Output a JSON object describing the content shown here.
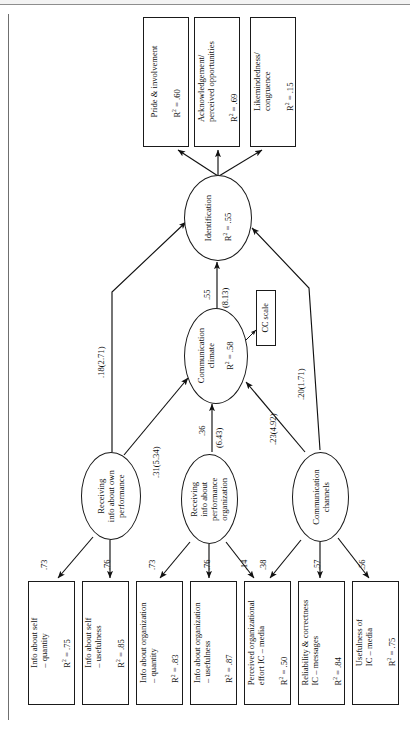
{
  "figure": {
    "type": "structural-equation-model-path-diagram",
    "orientation": "rotated-90-counterclockwise",
    "note_box": {
      "label": "CC scale"
    }
  },
  "outcomes": [
    {
      "id": "pride",
      "name": "Pride & involvement",
      "r2_label": "R² = .60",
      "r2": 0.6
    },
    {
      "id": "ack",
      "name": "Acknowledgement/\nperceived opportunities",
      "r2_label": "R² = .69",
      "r2": 0.69
    },
    {
      "id": "likeminded",
      "name": "Likemindedness/\ncongruence",
      "r2_label": "R² = .15",
      "r2": 0.15
    }
  ],
  "latents": [
    {
      "id": "identification",
      "name": "Identification",
      "r2_label": "R² = .55",
      "r2": 0.55
    },
    {
      "id": "climate",
      "name": "Communication\nclimate",
      "r2_label": "R² = .58",
      "r2": 0.58
    },
    {
      "id": "recv_own",
      "name": "Receiving\ninfo about own\nperformance",
      "r2_label": "",
      "r2": null
    },
    {
      "id": "recv_org",
      "name": "Receiving\ninfo about\nperformance\norganization",
      "r2_label": "",
      "r2": null
    },
    {
      "id": "channels",
      "name": "Communication\nchannels",
      "r2_label": "",
      "r2": null
    }
  ],
  "manifests": [
    {
      "id": "self_qty",
      "name": "Info about self\n– quantity",
      "r2_label": "R² = .75",
      "r2": 0.75
    },
    {
      "id": "self_use",
      "name": "Info about self\n– usefulness",
      "r2_label": "R² = .85",
      "r2": 0.85
    },
    {
      "id": "org_qty",
      "name": "Info about organization\n– quantity",
      "r2_label": "R² = .83",
      "r2": 0.83
    },
    {
      "id": "org_use",
      "name": "Info about organization\n– usefulness",
      "r2_label": "R² = .87",
      "r2": 0.87
    },
    {
      "id": "eff_media",
      "name": "Perceived organizational\neffort IC – media",
      "r2_label": "R² = .50",
      "r2": 0.5
    },
    {
      "id": "rel_msg",
      "name": "Reliability & correctness\nIC – messages",
      "r2_label": "R² = .84",
      "r2": 0.84
    },
    {
      "id": "use_media",
      "name": "Usefulness of\nIC – media",
      "r2_label": "R² = .75",
      "r2": 0.75
    }
  ],
  "structural_paths": [
    {
      "from": "recv_own",
      "to": "identification",
      "label": ".18(2.71)",
      "beta": 0.18,
      "t": 2.71
    },
    {
      "from": "recv_own",
      "to": "climate",
      "label": ".31(5.34)",
      "beta": 0.31,
      "t": 5.34
    },
    {
      "from": "recv_org",
      "to": "climate",
      "label": ".36",
      "label2": "(6.43)",
      "beta": 0.36,
      "t": 6.43
    },
    {
      "from": "channels",
      "to": "climate",
      "label": ".23(4.92)",
      "beta": 0.23,
      "t": 4.92
    },
    {
      "from": "channels",
      "to": "identification",
      "label": ".20(1.71)",
      "beta": 0.2,
      "t": 1.71
    },
    {
      "from": "climate",
      "to": "identification",
      "label": ".55",
      "label2": "(8.13)",
      "beta": 0.55,
      "t": 8.13
    }
  ],
  "loadings": [
    {
      "from": "recv_own",
      "to": "self_qty",
      "label": ".73",
      "value": 0.73
    },
    {
      "from": "recv_own",
      "to": "self_use",
      "label": ".76",
      "value": 0.76
    },
    {
      "from": "recv_org",
      "to": "org_qty",
      "label": ".73",
      "value": 0.73
    },
    {
      "from": "recv_org",
      "to": "org_use",
      "label": ".76",
      "value": 0.76
    },
    {
      "from": "recv_org",
      "to": "eff_media",
      "label": ".14",
      "value": 0.14
    },
    {
      "from": "channels",
      "to": "eff_media",
      "label": ".38",
      "value": 0.38
    },
    {
      "from": "channels",
      "to": "rel_msg",
      "label": ".57",
      "value": 0.57
    },
    {
      "from": "channels",
      "to": "use_media",
      "label": ".56",
      "value": 0.56
    }
  ]
}
